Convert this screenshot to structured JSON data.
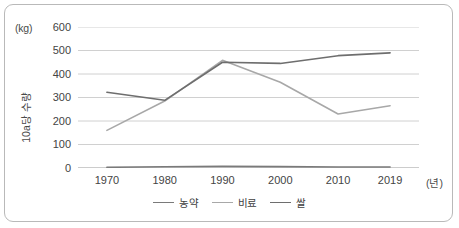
{
  "figure": {
    "y_unit": "(kg)",
    "x_unit": "(년)",
    "y_axis_title": "10a당 수량"
  },
  "legend": {
    "position": "bottom-center",
    "items": [
      {
        "label": "농약",
        "color": "#7a7a7a"
      },
      {
        "label": "비료",
        "color": "#a8a8a8"
      },
      {
        "label": "쌀",
        "color": "#6e6e6e"
      }
    ]
  },
  "chart_data": {
    "type": "line",
    "title": "",
    "xlabel": "(년)",
    "ylabel": "10a당 수량",
    "y_unit": "(kg)",
    "grid": true,
    "x": [
      1970,
      1980,
      1990,
      2000,
      2010,
      2019
    ],
    "categories": [
      "1970",
      "1980",
      "1990",
      "2000",
      "2010",
      "2019"
    ],
    "xticklabels": [
      "1970",
      "1980",
      "1990",
      "2000",
      "2010",
      "2019"
    ],
    "yticklabels": [
      "0",
      "100",
      "200",
      "300",
      "400",
      "500",
      "600"
    ],
    "yticks": [
      0,
      100,
      200,
      300,
      400,
      500,
      600
    ],
    "ylim": [
      0,
      600
    ],
    "xlim": [
      1965,
      2024
    ],
    "series": [
      {
        "name": "농약",
        "color": "#7a7a7a",
        "values": [
          3,
          5,
          7,
          6,
          4,
          4
        ]
      },
      {
        "name": "비료",
        "color": "#a8a8a8",
        "values": [
          160,
          285,
          458,
          365,
          230,
          265
        ]
      },
      {
        "name": "쌀",
        "color": "#6e6e6e",
        "values": [
          322,
          288,
          450,
          445,
          478,
          490
        ]
      }
    ]
  }
}
